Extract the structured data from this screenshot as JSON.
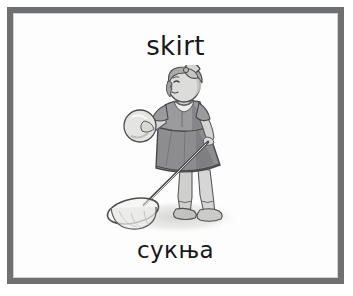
{
  "card": {
    "word_en": "skirt",
    "word_sr": "сукња",
    "frame_color": "#6f7072",
    "card_background": "#fdfdfd",
    "page_background": "#ffffff",
    "text_color": "#18181a"
  },
  "illustration": {
    "name": "girl-wearing-skirt-illustration",
    "description": "grayscale drawing of a girl in a skirt holding a ball and a butterfly net",
    "palette": {
      "outline": "#4a4a4c",
      "skirt": "#8d8d8f",
      "skirt_shade": "#7a7a7c",
      "bodice": "#9b9b9d",
      "skin": "#d8d8d6",
      "skin_shade": "#bdbdbb",
      "hair": "#a9a9a8",
      "ball": "#e2e2e0",
      "shoes": "#c9c9c7",
      "net_mesh": "#e8e8e6",
      "ground_shadow": "#dcdcda"
    }
  }
}
